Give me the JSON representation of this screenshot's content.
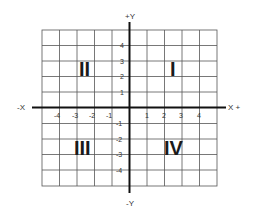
{
  "diagram": {
    "axis_labels": {
      "positive_y": "+Y",
      "negative_y": "-Y",
      "positive_x": "X +",
      "negative_x": "-X"
    },
    "x_ticks": [
      "-4",
      "-3",
      "-2",
      "-1",
      "1",
      "2",
      "3",
      "4"
    ],
    "y_ticks": [
      "4",
      "3",
      "2",
      "1",
      "-1",
      "-2",
      "-3",
      "-4"
    ],
    "quadrants": {
      "q1": "I",
      "q2": "II",
      "q3": "III",
      "q4": "IV"
    },
    "colors": {
      "grid": "#555555",
      "axis": "#111111",
      "background": "#ffffff"
    }
  }
}
